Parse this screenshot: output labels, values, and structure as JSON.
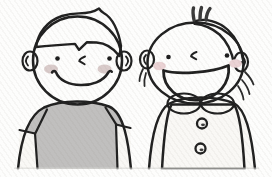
{
  "scene": {
    "type": "illustration",
    "description": "Black-and-white cartoon drawing of two smiling children side by side. Left: a boy with side-swept dark hair wearing a gray short-sleeved T-shirt, dot eyes, a small angled nose and a wide closed smile with rosy cheeks. Right: a child with a dark side fringe, small hair tufts on top, wisps by the ears, a big open laughing mouth, wearing a dark pinafore with a white scalloped collar and two round buttons. Both figures are cut off at a soft ground line near the bottom edge.",
    "figures": [
      {
        "id": "child-left",
        "label": "boy with side-swept hair",
        "expression": "closed-mouth smile",
        "outfit": "gray short-sleeve T-shirt"
      },
      {
        "id": "child-right",
        "label": "child with hair tufts",
        "expression": "open laughing mouth",
        "outfit": "dark pinafore, white scalloped collar, two buttons"
      }
    ]
  },
  "palette": {
    "background": "#fdfdfc",
    "outline": "#202020",
    "eye": "#1d1d1d",
    "hair": "#4a4a4a",
    "shirt": "#c0bfbe",
    "pinafore": "#555453",
    "skin": "#f4f2ee",
    "arm": "#f9f8f5",
    "blush_left_child": "#d9cbca",
    "blush_right_child": "#ead2d4",
    "mouth_open": "#fcfbf9",
    "button": "#f7f6f3",
    "button_dot": "#3c3c3c",
    "ground_shadow": "#d9d9d6"
  }
}
